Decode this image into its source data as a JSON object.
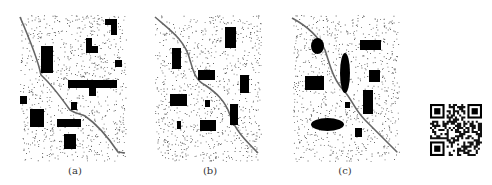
{
  "figure": {
    "panels": [
      {
        "id": "a",
        "label": "(a)",
        "label_x": 55,
        "area": {
          "x": 20,
          "y": 15,
          "w": 106,
          "h": 146
        },
        "road": "M20,17 C30,40 38,60 41,75 C52,85 60,96 70,110 C78,115 82,114 85,116 C98,125 110,140 118,152 L125,153",
        "rects": [
          {
            "x": 105,
            "y": 19,
            "w": 12,
            "h": 6
          },
          {
            "x": 111,
            "y": 19,
            "w": 6,
            "h": 16
          },
          {
            "x": 86,
            "y": 38,
            "w": 6,
            "h": 15
          },
          {
            "x": 86,
            "y": 46,
            "w": 12,
            "h": 7
          },
          {
            "x": 41,
            "y": 46,
            "w": 12,
            "h": 27
          },
          {
            "x": 115,
            "y": 60,
            "w": 7,
            "h": 7
          },
          {
            "x": 68,
            "y": 80,
            "w": 49,
            "h": 8
          },
          {
            "x": 89,
            "y": 88,
            "w": 7,
            "h": 8
          },
          {
            "x": 20,
            "y": 96,
            "w": 7,
            "h": 8
          },
          {
            "x": 71,
            "y": 102,
            "w": 6,
            "h": 8
          },
          {
            "x": 30,
            "y": 109,
            "w": 14,
            "h": 18
          },
          {
            "x": 57,
            "y": 119,
            "w": 24,
            "h": 8
          },
          {
            "x": 64,
            "y": 134,
            "w": 12,
            "h": 15
          }
        ],
        "ellipses": []
      },
      {
        "id": "b",
        "label": "(b)",
        "label_x": 190,
        "area": {
          "x": 155,
          "y": 15,
          "w": 106,
          "h": 146
        },
        "road": "M155,17 C170,30 185,40 190,60 C193,70 195,80 205,85 C215,92 225,100 230,115 C235,130 245,140 258,153",
        "rects": [
          {
            "x": 225,
            "y": 27,
            "w": 11,
            "h": 21
          },
          {
            "x": 172,
            "y": 48,
            "w": 9,
            "h": 21
          },
          {
            "x": 198,
            "y": 70,
            "w": 17,
            "h": 10
          },
          {
            "x": 240,
            "y": 75,
            "w": 9,
            "h": 18
          },
          {
            "x": 170,
            "y": 94,
            "w": 17,
            "h": 12
          },
          {
            "x": 205,
            "y": 100,
            "w": 5,
            "h": 7
          },
          {
            "x": 230,
            "y": 104,
            "w": 8,
            "h": 21
          },
          {
            "x": 177,
            "y": 121,
            "w": 4,
            "h": 8
          },
          {
            "x": 200,
            "y": 120,
            "w": 16,
            "h": 11
          }
        ],
        "ellipses": []
      },
      {
        "id": "c",
        "label": "(c)",
        "label_x": 325,
        "area": {
          "x": 293,
          "y": 15,
          "w": 106,
          "h": 146
        },
        "road": "M292,18 C305,25 318,35 325,50 C330,65 333,80 345,92 C352,100 355,110 365,120 C375,130 385,140 397,152",
        "rects": [
          {
            "x": 360,
            "y": 40,
            "w": 21,
            "h": 10
          },
          {
            "x": 305,
            "y": 76,
            "w": 19,
            "h": 14
          },
          {
            "x": 369,
            "y": 70,
            "w": 11,
            "h": 12
          },
          {
            "x": 363,
            "y": 90,
            "w": 10,
            "h": 24
          },
          {
            "x": 345,
            "y": 102,
            "w": 5,
            "h": 6
          },
          {
            "x": 355,
            "y": 128,
            "w": 7,
            "h": 9
          }
        ],
        "ellipses": [
          {
            "cx": 317.5,
            "cy": 46,
            "rx": 6.5,
            "ry": 8
          },
          {
            "cx": 345,
            "cy": 73,
            "rx": 5,
            "ry": 20
          },
          {
            "cx": 327.5,
            "cy": 124.5,
            "rx": 16.5,
            "ry": 6.5
          }
        ]
      }
    ],
    "qr": {
      "x": 430,
      "y": 104,
      "size": 52
    }
  }
}
